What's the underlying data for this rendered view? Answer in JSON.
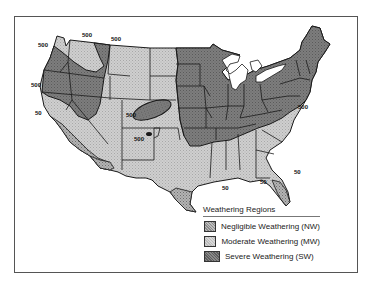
{
  "map": {
    "subject": "Weathering regions of the contiguous United States",
    "colors": {
      "negligible": "#a9a9a9",
      "moderate": "#c9c9c9",
      "severe": "#7a7a7a",
      "border": "#1a1a1a",
      "water": "#ffffff"
    },
    "contour_labels": [
      {
        "text": "500",
        "x": 42,
        "y": 47
      },
      {
        "text": "500",
        "x": 82,
        "y": 37
      },
      {
        "text": "500",
        "x": 111,
        "y": 41
      },
      {
        "text": "500",
        "x": 33,
        "y": 87
      },
      {
        "text": "50",
        "x": 35,
        "y": 115
      },
      {
        "text": "500",
        "x": 127,
        "y": 116
      },
      {
        "text": "500",
        "x": 135,
        "y": 141
      },
      {
        "text": "500",
        "x": 298,
        "y": 109
      },
      {
        "text": "50",
        "x": 222,
        "y": 190
      },
      {
        "text": "50",
        "x": 260,
        "y": 185
      },
      {
        "text": "50",
        "x": 293,
        "y": 174
      }
    ]
  },
  "legend": {
    "title": "Weathering Regions",
    "items": [
      {
        "label": "Negligible Weathering (NW)",
        "key": "negligible"
      },
      {
        "label": "Moderate Weathering (MW)",
        "key": "moderate"
      },
      {
        "label": "Severe Weathering (SW)",
        "key": "severe"
      }
    ]
  }
}
